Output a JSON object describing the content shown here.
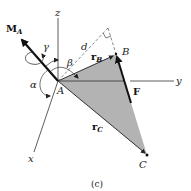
{
  "figure": {
    "caption": "(c)",
    "axes": {
      "z_label": "z",
      "y_label": "y",
      "x_label": "x"
    },
    "points": {
      "A": "A",
      "B": "B",
      "C": "C"
    },
    "vectors": {
      "moment_label": "M",
      "moment_sub": "A",
      "force_label": "F",
      "rB_label": "r",
      "rB_sub": "B",
      "rC_label": "r",
      "rC_sub": "C"
    },
    "angles": {
      "alpha": "α",
      "beta": "β",
      "gamma": "γ"
    },
    "distance_label": "d",
    "colors": {
      "triangle_fill": "#b3b3b3",
      "line": "#222222",
      "background": "#ffffff"
    }
  }
}
